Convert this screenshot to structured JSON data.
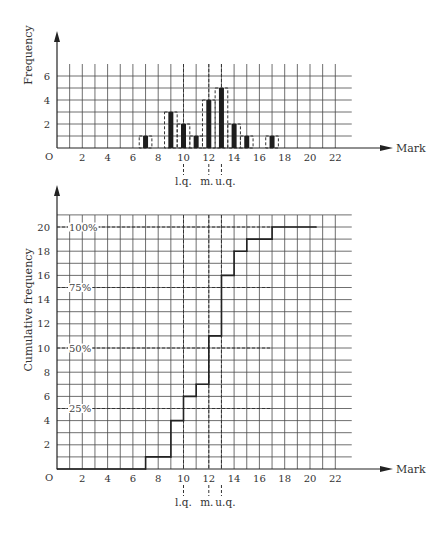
{
  "chart_data": [
    {
      "type": "bar",
      "title": "",
      "xlabel": "Mark",
      "ylabel": "Frequency",
      "origin_label": "O",
      "x": [
        7,
        9,
        10,
        11,
        12,
        13,
        14,
        15,
        17
      ],
      "values": [
        1,
        3,
        2,
        1,
        4,
        5,
        2,
        1,
        1
      ],
      "xlim": [
        0,
        23
      ],
      "ylim": [
        0,
        6.9
      ],
      "xticks": [
        2,
        4,
        6,
        8,
        10,
        12,
        14,
        16,
        18,
        20,
        22
      ],
      "yticks": [
        2,
        4,
        6
      ],
      "grid": true,
      "dashed_outline_width": 1,
      "quartile_markers": [
        {
          "name": "l.q.",
          "x": 10
        },
        {
          "name": "m.",
          "x": 12
        },
        {
          "name": "u.q.",
          "x": 13
        }
      ]
    },
    {
      "type": "line",
      "style": "step",
      "title": "",
      "xlabel": "Mark",
      "ylabel": "Cumulative frequency",
      "origin_label": "O",
      "points": [
        [
          0,
          0
        ],
        [
          7,
          0
        ],
        [
          7,
          1
        ],
        [
          9,
          1
        ],
        [
          9,
          4
        ],
        [
          10,
          4
        ],
        [
          10,
          6
        ],
        [
          11,
          6
        ],
        [
          11,
          7
        ],
        [
          12,
          7
        ],
        [
          12,
          11
        ],
        [
          13,
          11
        ],
        [
          13,
          16
        ],
        [
          14,
          16
        ],
        [
          14,
          18
        ],
        [
          15,
          18
        ],
        [
          15,
          19
        ],
        [
          17,
          19
        ],
        [
          17,
          20
        ],
        [
          20.5,
          20
        ]
      ],
      "xlim": [
        0,
        23
      ],
      "ylim": [
        0,
        21
      ],
      "xticks": [
        2,
        4,
        6,
        8,
        10,
        12,
        14,
        16,
        18,
        20,
        22
      ],
      "yticks": [
        2,
        4,
        6,
        8,
        10,
        12,
        14,
        16,
        18,
        20
      ],
      "grid": true,
      "percent_lines": [
        {
          "label": "25%",
          "y": 5
        },
        {
          "label": "50%",
          "y": 10
        },
        {
          "label": "75%",
          "y": 15
        },
        {
          "label": "100%",
          "y": 20
        }
      ],
      "percent_lines_extent_x": 17,
      "quartile_markers": [
        {
          "name": "l.q.",
          "x": 10
        },
        {
          "name": "m.",
          "x": 12
        },
        {
          "name": "u.q.",
          "x": 13
        }
      ]
    }
  ]
}
